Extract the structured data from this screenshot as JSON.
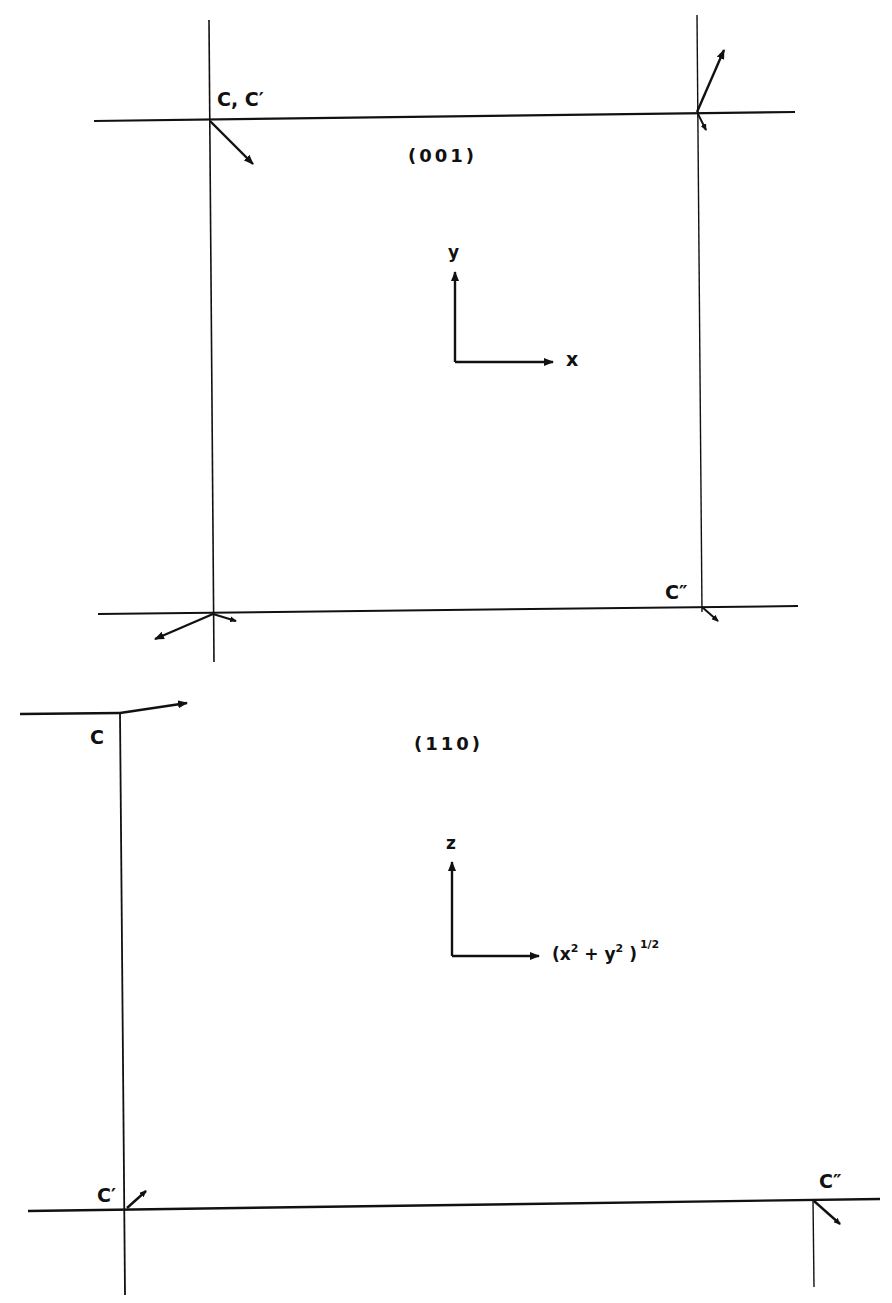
{
  "figure": {
    "panels": [
      {
        "plane_label": "(001)",
        "corner_labels": {
          "top_left": "C, C′",
          "bottom_right": "C″"
        },
        "axes": {
          "vertical": "y",
          "horizontal": "x"
        }
      },
      {
        "plane_label": "(110)",
        "corner_labels": {
          "top_left": "C",
          "bottom_left": "C′",
          "bottom_right": "C″"
        },
        "axes": {
          "vertical": "z",
          "horizontal_base": "(x",
          "horizontal_sup1": "2",
          "horizontal_mid": " + y",
          "horizontal_sup2": "2",
          "horizontal_close": " )",
          "horizontal_exp": "1/2"
        }
      }
    ],
    "colors": {
      "ink": "#111111",
      "background": "#ffffff"
    }
  }
}
